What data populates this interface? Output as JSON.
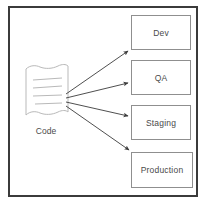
{
  "diagram": {
    "background_color": "#ffffff",
    "frame_color": "#3b3b3b",
    "box_border_color": "#8f8f8f",
    "arrow_color": "#3b3b3b",
    "text_color": "#4a4a4a",
    "source": {
      "label": "Code",
      "shape": "document",
      "text_line_count": 4
    },
    "targets": [
      {
        "label": "Dev"
      },
      {
        "label": "QA"
      },
      {
        "label": "Staging"
      },
      {
        "label": "Production"
      }
    ],
    "connections": [
      {
        "from": "Code",
        "to": "Dev"
      },
      {
        "from": "Code",
        "to": "QA"
      },
      {
        "from": "Code",
        "to": "Staging"
      },
      {
        "from": "Code",
        "to": "Production"
      }
    ]
  }
}
